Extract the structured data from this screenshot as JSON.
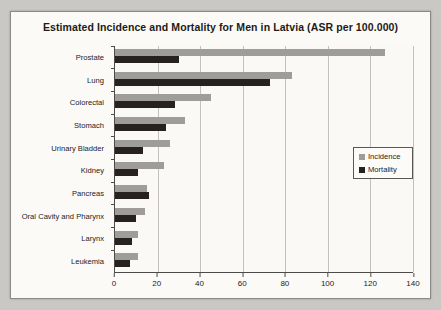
{
  "chart_data": {
    "type": "bar",
    "orientation": "horizontal",
    "title": "Estimated Incidence and Mortality for Men in Latvia (ASR per 100.000)",
    "categories": [
      "Prostate",
      "Lung",
      "Colorectal",
      "Stomach",
      "Urinary Bladder",
      "Kidney",
      "Pancreas",
      "Oral Cavity and Pharynx",
      "Larynx",
      "Leukemia"
    ],
    "series": [
      {
        "name": "Incidence",
        "color": "#9e9d99",
        "values": [
          127,
          83,
          45,
          33,
          26,
          23,
          15,
          14,
          11,
          11
        ]
      },
      {
        "name": "Mortality",
        "color": "#27211f",
        "values": [
          30,
          73,
          28,
          24,
          13,
          11,
          16,
          10,
          8,
          7
        ]
      }
    ],
    "xlabel": "",
    "ylabel": "",
    "xlim": [
      0,
      140
    ],
    "x_ticks": [
      0,
      20,
      40,
      60,
      80,
      100,
      120,
      140
    ],
    "grid": "vertical",
    "legend_position": "right-inside"
  },
  "colors": {
    "incidence": "#9e9d99",
    "mortality": "#27211f",
    "gridline": "#c2c1bd",
    "axis": "#4d4b49"
  }
}
